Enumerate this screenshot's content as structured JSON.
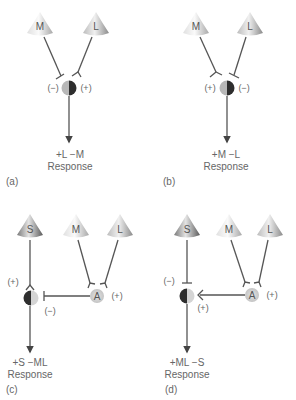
{
  "figure": {
    "colors": {
      "line": "#555555",
      "cone_light": "#f2f2f2",
      "cone_dark": "#888888",
      "cone_s_dark": "#6a6a6a",
      "cell_light": "#c8c8c8",
      "cell_dark": "#3a3a3a",
      "amacrine_fill": "#d8d8d8"
    },
    "panels": [
      {
        "id": "(a)",
        "cones": [
          {
            "label": "M"
          },
          {
            "label": "L"
          }
        ],
        "inputs": [
          {
            "from": "M",
            "sign": "(−)"
          },
          {
            "from": "L",
            "sign": "(+)"
          }
        ],
        "response_line1": "+L −M",
        "response_line2": "Response"
      },
      {
        "id": "(b)",
        "cones": [
          {
            "label": "M"
          },
          {
            "label": "L"
          }
        ],
        "inputs": [
          {
            "from": "M",
            "sign": "(+)"
          },
          {
            "from": "L",
            "sign": "(−)"
          }
        ],
        "response_line1": "+M −L",
        "response_line2": "Response"
      },
      {
        "id": "(c)",
        "cones": [
          {
            "label": "S"
          },
          {
            "label": "M"
          },
          {
            "label": "L"
          }
        ],
        "intermediate": {
          "label": "A",
          "sign": "(+)"
        },
        "inputs": [
          {
            "from": "S",
            "sign": "(+)"
          },
          {
            "from": "A",
            "sign": "(−)"
          }
        ],
        "response_line1": "+S −ML",
        "response_line2": "Response"
      },
      {
        "id": "(d)",
        "cones": [
          {
            "label": "S"
          },
          {
            "label": "M"
          },
          {
            "label": "L"
          }
        ],
        "intermediate": {
          "label": "A",
          "sign": "(+)"
        },
        "inputs": [
          {
            "from": "S",
            "sign": "(−)"
          },
          {
            "from": "A",
            "sign": "(+)"
          }
        ],
        "response_line1": "+ML −S",
        "response_line2": "Response"
      }
    ]
  }
}
